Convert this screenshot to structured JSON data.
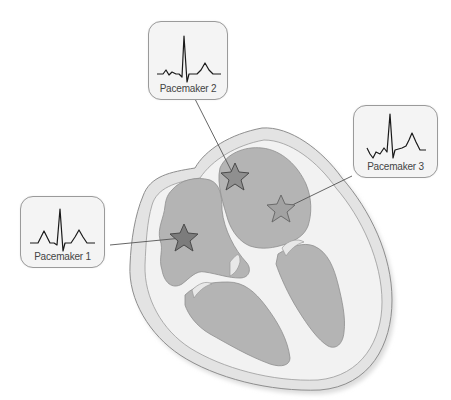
{
  "diagram": {
    "type": "heart cross-section with ectopic pacemaker sites",
    "colors": {
      "background": "#ffffff",
      "outer_wall": "#e3e3e3",
      "myocardium": "#f2f2f2",
      "chamber": "#b4b4b4",
      "outline": "#8e8e8e",
      "star_dark": "#7c7c7c",
      "star_mid": "#8f8f8f",
      "star_light": "#a2a2a2",
      "leader_line": "#555555",
      "box_fill": "#f4f4f4",
      "ecg_trace": "#1a1a1a"
    },
    "pacemakers": [
      {
        "id": 1,
        "label": "Pacemaker 1",
        "location": "left chamber (lower-left region)",
        "waveform": "normal P-QRS-T with upright P wave"
      },
      {
        "id": 2,
        "label": "Pacemaker 2",
        "location": "upper chamber, top",
        "waveform": "small notched P wave, tall QRS, T wave"
      },
      {
        "id": 3,
        "label": "Pacemaker 3",
        "location": "upper chamber, lower right",
        "waveform": "inverted/retrograde P wave, tall QRS, T wave"
      }
    ]
  }
}
